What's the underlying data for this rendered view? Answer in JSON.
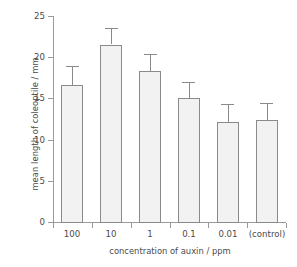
{
  "chart_data": {
    "type": "bar",
    "title": "",
    "subtitle": "",
    "xlabel": "concentration of auxin / ppm",
    "ylabel": "mean length of coleoptile / mm",
    "categories": [
      "100",
      "10",
      "1",
      "0.1",
      "0.01",
      "(control)"
    ],
    "values": [
      16.6,
      21.5,
      18.3,
      15.0,
      12.1,
      12.4
    ],
    "errors": [
      2.3,
      2.0,
      2.1,
      2.0,
      2.2,
      2.1
    ],
    "error_upper": [
      18.9,
      23.5,
      20.4,
      17.0,
      14.3,
      14.5
    ],
    "error_direction": "up-only",
    "ylim": [
      0,
      25
    ],
    "yticks": [
      0,
      5,
      10,
      15,
      20,
      25
    ],
    "ytick_labels": [
      "0",
      "5",
      "10",
      "15",
      "20",
      "25"
    ],
    "grid": false,
    "legend": null,
    "legend_position": "none",
    "colors": {
      "bar_fill": "#f2f2f2",
      "bar_edge": "#8a8a8a",
      "axis": "#9a9a9a",
      "text": "#4a4a4a",
      "background": "#ffffff"
    }
  }
}
